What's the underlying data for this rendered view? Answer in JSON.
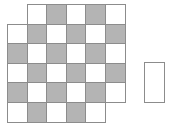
{
  "colors": {
    "shaded": "#b4b4b4",
    "empty": "#ffffff",
    "border": "#8c8c8c"
  },
  "grid": {
    "origin_x": 7,
    "origin_y": 4,
    "cell_w": 19.6,
    "cell_h": 19.6,
    "rows": [
      [
        null,
        "W",
        "G",
        "W",
        "G",
        "W"
      ],
      [
        "W",
        "G",
        "W",
        "G",
        "W",
        "G"
      ],
      [
        "G",
        "W",
        "G",
        "W",
        "G",
        "W"
      ],
      [
        "W",
        "G",
        "W",
        "G",
        "W",
        "G"
      ],
      [
        "G",
        "W",
        "G",
        "W",
        "G",
        "W"
      ],
      [
        "W",
        "G",
        "W",
        "G",
        "W",
        null
      ]
    ]
  },
  "piece": {
    "x": 144,
    "y": 62,
    "w": 21,
    "h": 41
  }
}
